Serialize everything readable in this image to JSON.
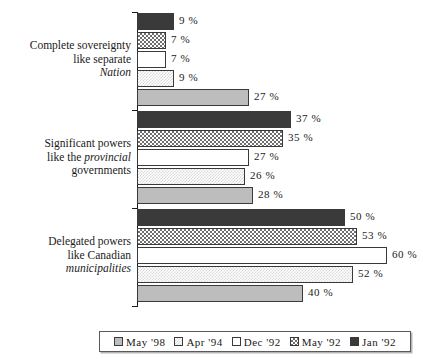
{
  "chart_data": {
    "type": "bar",
    "orientation": "horizontal",
    "title": "",
    "xlabel": "",
    "ylabel": "",
    "xlim": [
      0,
      60
    ],
    "grid": false,
    "legend_position": "bottom",
    "value_suffix": "%",
    "categories": [
      "Complete sovereignty like separate Nation",
      "Significant powers like the provincial governments",
      "Delegated powers like Canadian municipalities"
    ],
    "series": [
      {
        "name": "Jan '92",
        "swatch": "solid-black",
        "color": "#3a3a3a",
        "values": [
          9,
          37,
          50
        ]
      },
      {
        "name": "May '92",
        "swatch": "dark-checker",
        "color": "#6e6e6e",
        "values": [
          7,
          35,
          53
        ]
      },
      {
        "name": "Dec '92",
        "swatch": "white",
        "color": "#ffffff",
        "values": [
          7,
          27,
          60
        ]
      },
      {
        "name": "Apr '94",
        "swatch": "light-checker",
        "color": "#d8d8d8",
        "values": [
          9,
          26,
          52
        ]
      },
      {
        "name": "May '98",
        "swatch": "solid-gray",
        "color": "#bdbdbd",
        "values": [
          27,
          28,
          40
        ]
      }
    ]
  },
  "groups": [
    {
      "label_line1": "Complete sovereignty",
      "label_line2": "like separate",
      "label_line3_italic": "Nation",
      "bars": [
        {
          "series": "Jan '92",
          "value_label": "9 %",
          "pct": 9
        },
        {
          "series": "May '92",
          "value_label": "7 %",
          "pct": 7
        },
        {
          "series": "Dec '92",
          "value_label": "7 %",
          "pct": 7
        },
        {
          "series": "Apr '94",
          "value_label": "9 %",
          "pct": 9
        },
        {
          "series": "May '98",
          "value_label": "27 %",
          "pct": 27
        }
      ]
    },
    {
      "label_line1": "Significant powers",
      "label_line2_pre": "like the ",
      "label_line2_italic": "provincial",
      "label_line3": "governments",
      "bars": [
        {
          "series": "Jan '92",
          "value_label": "37 %",
          "pct": 37
        },
        {
          "series": "May '92",
          "value_label": "35 %",
          "pct": 35
        },
        {
          "series": "Dec '92",
          "value_label": "27 %",
          "pct": 27
        },
        {
          "series": "Apr '94",
          "value_label": "26 %",
          "pct": 26
        },
        {
          "series": "May '98",
          "value_label": "28 %",
          "pct": 28
        }
      ]
    },
    {
      "label_line1": "Delegated powers",
      "label_line2": "like Canadian",
      "label_line3_italic": "municipalities",
      "bars": [
        {
          "series": "Jan '92",
          "value_label": "50 %",
          "pct": 50
        },
        {
          "series": "May '92",
          "value_label": "53 %",
          "pct": 53
        },
        {
          "series": "Dec '92",
          "value_label": "60 %",
          "pct": 60
        },
        {
          "series": "Apr '94",
          "value_label": "52 %",
          "pct": 52
        },
        {
          "series": "May '98",
          "value_label": "40 %",
          "pct": 40
        }
      ]
    }
  ],
  "legend": {
    "items": [
      {
        "label": "May '98",
        "fill_class": "fill-may98"
      },
      {
        "label": "Apr '94",
        "fill_class": "fill-apr94"
      },
      {
        "label": "Dec '92",
        "fill_class": "fill-dec92"
      },
      {
        "label": "May '92",
        "fill_class": "fill-may92"
      },
      {
        "label": "Jan '92",
        "fill_class": "fill-jan92"
      }
    ]
  }
}
